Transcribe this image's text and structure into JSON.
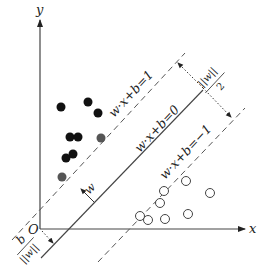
{
  "diagram": {
    "axes": {
      "x_label": "x",
      "y_label": "y",
      "origin_label": "O"
    },
    "hyperplanes": {
      "upper": "w·x+b=1",
      "middle": "w·x+b=0",
      "lower": "w·x+b=−1"
    },
    "normal_vector_label": "w",
    "offset_label_num": "b",
    "offset_label_den": "||w||",
    "margin_label_num": "2",
    "margin_label_den": "||w||",
    "colors": {
      "line": "#333333",
      "positive_class": "#111111",
      "support_vector": "#555555",
      "negative_class": "#ffffff"
    },
    "positive_points": [
      [
        61,
        107
      ],
      [
        88,
        102
      ],
      [
        98,
        113
      ],
      [
        70,
        137
      ],
      [
        78,
        137
      ],
      [
        66,
        158
      ],
      [
        73,
        154
      ]
    ],
    "positive_support_vectors": [
      [
        101,
        138
      ],
      [
        62,
        177
      ]
    ],
    "negative_points": [
      [
        186,
        181
      ],
      [
        210,
        193
      ],
      [
        160,
        203
      ],
      [
        188,
        214
      ],
      [
        148,
        220
      ],
      [
        165,
        219
      ]
    ],
    "negative_support_vectors": [
      [
        164,
        191
      ],
      [
        140,
        216
      ]
    ]
  }
}
